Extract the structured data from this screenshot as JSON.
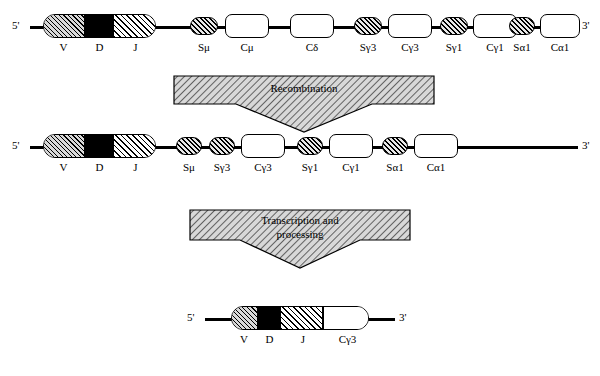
{
  "diagram": {
    "five_prime": "5'",
    "three_prime": "3'",
    "rows": [
      {
        "name": "germline-dna",
        "labels": [
          "V",
          "D",
          "J",
          "Sμ",
          "Cμ",
          "Cδ",
          "Sγ3",
          "Cγ3",
          "Sγ1",
          "Cγ1",
          "Sα1",
          "Cα1"
        ]
      },
      {
        "name": "recombined-dna",
        "labels": [
          "V",
          "D",
          "J",
          "Sμ",
          "Sγ3",
          "Cγ3",
          "Sγ1",
          "Cγ1",
          "Sα1",
          "Cα1"
        ]
      },
      {
        "name": "mature-mrna",
        "labels": [
          "V",
          "D",
          "J",
          "Cγ3"
        ]
      }
    ],
    "arrows": [
      {
        "name": "recombination-arrow",
        "label": "Recombination"
      },
      {
        "name": "transcription-arrow",
        "label": "Transcription and\nprocessing",
        "line1": "Transcription and",
        "line2": "processing"
      }
    ],
    "colors": {
      "line": "#000000",
      "background": "#ffffff",
      "hatch": "#000000",
      "box_fill": "#ffffff"
    }
  }
}
